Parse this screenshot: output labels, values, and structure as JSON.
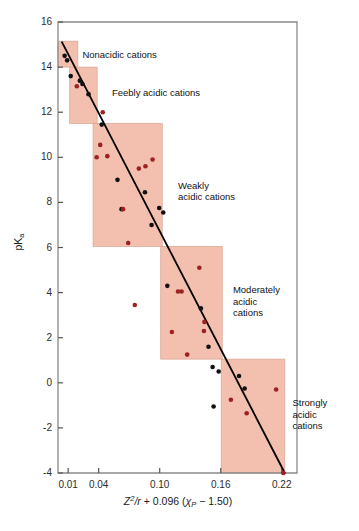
{
  "figure": {
    "background": "#ffffff",
    "frame_color": "#8a8a8a",
    "shade_color": "#f3bfae",
    "shade_border": "#d9a392",
    "trend_color": "#000000",
    "dot_black": "#111111",
    "dot_red": "#9e2121"
  },
  "axes": {
    "y_title": "pKa",
    "y_title_main": "pK",
    "y_title_sub": "a",
    "x_title_full": "Z2/r + 0.096 (χP − 1.50)",
    "x_parts": {
      "z": "Z",
      "z_exp": "2",
      "over_r": "/r",
      "plus": " + 0.096 (",
      "chi": "χ",
      "chi_sub": "P",
      "minus_close": " − 1.50)"
    }
  },
  "chart_data": {
    "type": "scatter",
    "title": "",
    "xlabel": "Z²/r + 0.096 (χP − 1.50)",
    "ylabel": "pKa",
    "xlim": [
      0.0,
      0.235
    ],
    "ylim": [
      -4,
      16
    ],
    "grid": false,
    "legend": "none",
    "xticks": [
      {
        "value": 0.01,
        "label": "0.01"
      },
      {
        "value": 0.04,
        "label": "0.04"
      },
      {
        "value": 0.1,
        "label": "0.10"
      },
      {
        "value": 0.16,
        "label": "0.16"
      },
      {
        "value": 0.22,
        "label": "0.22"
      }
    ],
    "yticks": [
      {
        "value": 16,
        "label": "16"
      },
      {
        "value": 14,
        "label": "14"
      },
      {
        "value": 12,
        "label": "12"
      },
      {
        "value": 10,
        "label": "10"
      },
      {
        "value": 8,
        "label": "8"
      },
      {
        "value": 6,
        "label": "6"
      },
      {
        "value": 4,
        "label": "4"
      },
      {
        "value": 2,
        "label": "2"
      },
      {
        "value": 0,
        "label": "0"
      },
      {
        "value": -2,
        "label": "-2"
      },
      {
        "value": -4,
        "label": "-4"
      }
    ],
    "trend_line": {
      "x": [
        0.004,
        0.223
      ],
      "y": [
        15.1,
        -4.0
      ],
      "color": "#000000",
      "width": 1.8
    },
    "series": [
      {
        "name": "black-points",
        "color": "#111111",
        "points": [
          {
            "x": 0.0065,
            "y": 14.5
          },
          {
            "x": 0.009,
            "y": 14.3
          },
          {
            "x": 0.0125,
            "y": 13.6
          },
          {
            "x": 0.0215,
            "y": 13.4
          },
          {
            "x": 0.024,
            "y": 13.25
          },
          {
            "x": 0.03,
            "y": 12.8
          },
          {
            "x": 0.043,
            "y": 11.45
          },
          {
            "x": 0.0585,
            "y": 9.0
          },
          {
            "x": 0.0855,
            "y": 8.45
          },
          {
            "x": 0.0625,
            "y": 7.7
          },
          {
            "x": 0.0995,
            "y": 7.75
          },
          {
            "x": 0.1035,
            "y": 7.55
          },
          {
            "x": 0.092,
            "y": 7.0
          },
          {
            "x": 0.1075,
            "y": 4.3
          },
          {
            "x": 0.1405,
            "y": 3.3
          },
          {
            "x": 0.148,
            "y": 1.6
          },
          {
            "x": 0.152,
            "y": 0.7
          },
          {
            "x": 0.158,
            "y": 0.5
          },
          {
            "x": 0.178,
            "y": 0.3
          },
          {
            "x": 0.1835,
            "y": -0.25
          },
          {
            "x": 0.153,
            "y": -1.05
          }
        ]
      },
      {
        "name": "red-points",
        "color": "#9e2121",
        "points": [
          {
            "x": 0.0185,
            "y": 13.15
          },
          {
            "x": 0.044,
            "y": 12.0
          },
          {
            "x": 0.0415,
            "y": 10.55
          },
          {
            "x": 0.038,
            "y": 10.0
          },
          {
            "x": 0.0485,
            "y": 10.05
          },
          {
            "x": 0.093,
            "y": 9.9
          },
          {
            "x": 0.086,
            "y": 9.6
          },
          {
            "x": 0.0795,
            "y": 9.5
          },
          {
            "x": 0.064,
            "y": 7.7
          },
          {
            "x": 0.069,
            "y": 6.2
          },
          {
            "x": 0.139,
            "y": 5.1
          },
          {
            "x": 0.118,
            "y": 4.05
          },
          {
            "x": 0.1215,
            "y": 4.05
          },
          {
            "x": 0.0755,
            "y": 3.45
          },
          {
            "x": 0.144,
            "y": 2.7
          },
          {
            "x": 0.1435,
            "y": 2.3
          },
          {
            "x": 0.112,
            "y": 2.25
          },
          {
            "x": 0.127,
            "y": 1.25
          },
          {
            "x": 0.17,
            "y": -0.75
          },
          {
            "x": 0.1855,
            "y": -1.35
          },
          {
            "x": 0.2145,
            "y": -0.3
          },
          {
            "x": 0.2215,
            "y": -4.0
          }
        ]
      }
    ],
    "regions": [
      {
        "id": "nonacidic",
        "label": "Nonacidic cations",
        "x0": 0.0,
        "x1": 0.0195,
        "y0": 14.0,
        "y1": 15.15,
        "label_x": 0.024,
        "label_y": 14.55
      },
      {
        "id": "feebly-acidic",
        "label": "Feebly acidic cations",
        "x0": 0.0115,
        "x1": 0.0385,
        "y0": 11.5,
        "y1": 14.0,
        "label_x": 0.053,
        "label_y": 12.85
      },
      {
        "id": "weakly-acidic",
        "label": "Weakly\nacidic cations",
        "x0": 0.0345,
        "x1": 0.1025,
        "y0": 6.05,
        "y1": 11.5,
        "label_x": 0.118,
        "label_y": 8.5
      },
      {
        "id": "moderately-acidic",
        "label": "Moderately\nacidic\ncations",
        "x0": 0.101,
        "x1": 0.1615,
        "y0": 1.05,
        "y1": 6.05,
        "label_x": 0.172,
        "label_y": 3.6
      },
      {
        "id": "strongly-acidic",
        "label": "Strongly\nacidic\ncations",
        "x0": 0.1605,
        "x1": 0.223,
        "y0": -4.0,
        "y1": 1.05,
        "label_x": 0.2305,
        "label_y": -1.4
      }
    ]
  }
}
